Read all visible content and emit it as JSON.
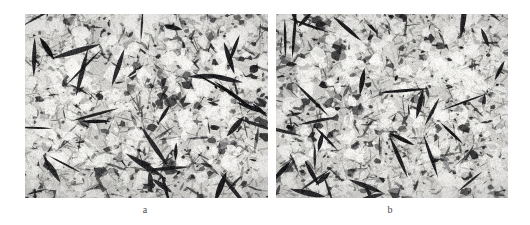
{
  "figure": {
    "type": "micrograph-pair",
    "background_color": "#ffffff",
    "width": 530,
    "height": 225,
    "panels": [
      {
        "id": "panel-a",
        "label": "a",
        "label_x": 145,
        "label_y": 205,
        "x": 25,
        "y": 14,
        "width": 243,
        "height": 184,
        "description": "grayscale optical micrograph, light matrix with dark acicular needle-like features",
        "seed": 1737,
        "base_gray": "#e8e6e2",
        "dark_gray": "#1a1a1a",
        "mid_gray": "#8a8a86",
        "density": 0.52,
        "needle_count": 560,
        "blob_count": 330
      },
      {
        "id": "panel-b",
        "label": "b",
        "label_x": 390,
        "label_y": 205,
        "x": 276,
        "y": 14,
        "width": 232,
        "height": 184,
        "description": "grayscale optical micrograph, light matrix with dark acicular needle-like features, slightly coarser",
        "seed": 4211,
        "base_gray": "#eae8e4",
        "dark_gray": "#1a1a1a",
        "mid_gray": "#8d8d89",
        "density": 0.5,
        "needle_count": 540,
        "blob_count": 310
      }
    ],
    "label_color": "#4a4a4a",
    "label_font_size_px": 10
  }
}
